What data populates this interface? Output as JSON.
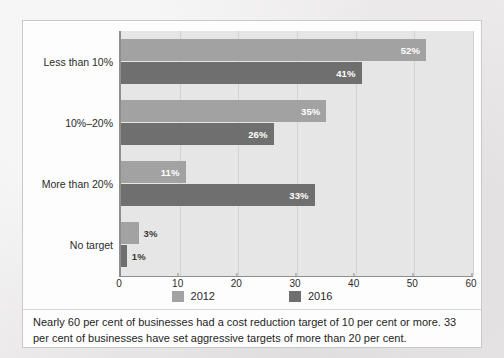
{
  "chart_data": {
    "type": "bar",
    "orientation": "horizontal",
    "title": "",
    "xlabel": "",
    "ylabel": "",
    "xlim": [
      0,
      60
    ],
    "xticks": [
      0,
      10,
      20,
      30,
      40,
      50,
      60
    ],
    "grid": true,
    "legend_position": "bottom",
    "categories": [
      "Less than 10%",
      "10%–20%",
      "More than 20%",
      "No target"
    ],
    "series": [
      {
        "name": "2012",
        "color": "#a2a2a2",
        "values": [
          52,
          35,
          11,
          3
        ],
        "labels": [
          "52%",
          "35%",
          "11%",
          "3%"
        ],
        "label_inside": [
          true,
          true,
          true,
          false
        ]
      },
      {
        "name": "2016",
        "color": "#6f6f6f",
        "values": [
          41,
          26,
          33,
          1
        ],
        "labels": [
          "41%",
          "26%",
          "33%",
          "1%"
        ],
        "label_inside": [
          true,
          true,
          true,
          false
        ]
      }
    ]
  },
  "caption": {
    "text": "Nearly 60 per cent of businesses had a cost reduction target of 10 per cent or more. 33 per cent of businesses have set aggressive targets of more than 20 per cent."
  }
}
